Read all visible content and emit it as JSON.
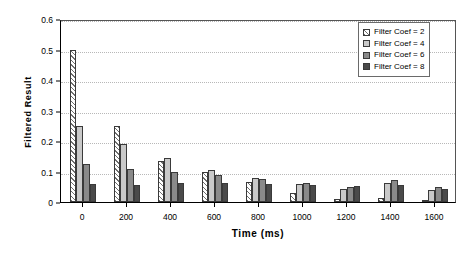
{
  "chart_data": {
    "type": "bar",
    "title": "",
    "xlabel": "Time (ms)",
    "ylabel": "Filtered  Result",
    "categories": [
      0,
      200,
      400,
      600,
      800,
      1000,
      1200,
      1400,
      1600
    ],
    "x_tick_labels": [
      "0",
      "200",
      "400",
      "600",
      "800",
      "1000",
      "1200",
      "1400",
      "1600"
    ],
    "y_tick_labels": [
      "0",
      "0.1",
      "0.2",
      "0.3",
      "0.4",
      "0.5",
      "0.6"
    ],
    "y_tick_values": [
      0,
      0.1,
      0.2,
      0.3,
      0.4,
      0.5,
      0.6
    ],
    "ylim": [
      0,
      0.6
    ],
    "grid": "horizontal-dotted",
    "legend_position": "top-right",
    "series": [
      {
        "name": "Filter Coef = 2",
        "fill": "diagonal-hatch",
        "color": "#ffffff",
        "values": [
          0.5,
          0.25,
          0.135,
          0.098,
          0.065,
          0.03,
          0.01,
          0.012,
          0.008
        ]
      },
      {
        "name": "Filter Coef = 4",
        "fill": "solid",
        "color": "#c9c9c9",
        "values": [
          0.25,
          0.19,
          0.145,
          0.105,
          0.08,
          0.06,
          0.042,
          0.062,
          0.04
        ]
      },
      {
        "name": "Filter Coef = 6",
        "fill": "solid",
        "color": "#8a8a8a",
        "values": [
          0.125,
          0.108,
          0.098,
          0.09,
          0.075,
          0.062,
          0.05,
          0.072,
          0.048
        ]
      },
      {
        "name": "Filter Coef = 8",
        "fill": "solid",
        "color": "#4a4a4a",
        "values": [
          0.06,
          0.055,
          0.062,
          0.063,
          0.06,
          0.055,
          0.052,
          0.055,
          0.042
        ]
      }
    ]
  }
}
